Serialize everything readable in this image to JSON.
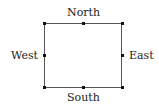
{
  "diagram": {
    "labels": {
      "north": "North",
      "south": "South",
      "east": "East",
      "west": "West"
    },
    "shape": "rectangle",
    "points": [
      "top-left",
      "top-mid",
      "top-right",
      "mid-left",
      "mid-right",
      "bottom-left",
      "bottom-mid",
      "bottom-right"
    ]
  }
}
